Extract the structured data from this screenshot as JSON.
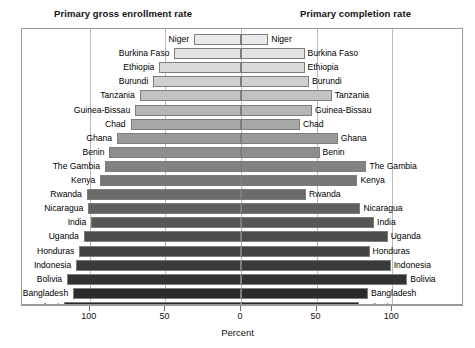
{
  "header": {
    "left_title": "Primary gross enrollment rate",
    "right_title": "Primary completion rate"
  },
  "axis": {
    "title": "Percent",
    "tick_labels": [
      "100",
      "50",
      "0",
      "50",
      "100"
    ],
    "center_value": 0,
    "px_per_percent": 1.512,
    "center_x": 219
  },
  "chart_data": {
    "type": "bar",
    "subtype": "diverging-population-pyramid",
    "title": "",
    "xlabel": "Percent",
    "ylabel": "",
    "grid": true,
    "legend_position": "top",
    "xlim": [
      -125,
      125
    ],
    "xticks": [
      -100,
      -50,
      0,
      50,
      100
    ],
    "xticklabels": [
      "100",
      "50",
      "0",
      "50",
      "100"
    ],
    "series": [
      {
        "name": "Primary gross enrollment rate",
        "side": "left"
      },
      {
        "name": "Primary completion rate",
        "side": "right"
      }
    ],
    "categories": [
      "Niger",
      "Burkina Faso",
      "Ethiopia",
      "Burundi",
      "Tanzania",
      "Guinea-Bissau",
      "Chad",
      "Ghana",
      "Benin",
      "The Gambia",
      "Kenya",
      "Rwanda",
      "Nicaragua",
      "India",
      "Uganda",
      "Honduras",
      "Indonesia",
      "Bolivia",
      "Bangladesh",
      "Malawi"
    ],
    "rows": [
      {
        "country": "Niger",
        "enrollment": 31,
        "completion": 18,
        "shade": "#eaeaea"
      },
      {
        "country": "Burkina Faso",
        "enrollment": 44,
        "completion": 42,
        "shade": "#e2e2e2"
      },
      {
        "country": "Ethiopia",
        "enrollment": 54,
        "completion": 42,
        "shade": "#dadada"
      },
      {
        "country": "Burundi",
        "enrollment": 58,
        "completion": 45,
        "shade": "#d0d0d0"
      },
      {
        "country": "Tanzania",
        "enrollment": 67,
        "completion": 60,
        "shade": "#c2c2c2"
      },
      {
        "country": "Guinea-Bissau",
        "enrollment": 70,
        "completion": 47,
        "shade": "#b6b6b6"
      },
      {
        "country": "Chad",
        "enrollment": 73,
        "completion": 39,
        "shade": "#a8a8a8"
      },
      {
        "country": "Ghana",
        "enrollment": 82,
        "completion": 64,
        "shade": "#9a9a9a"
      },
      {
        "country": "Benin",
        "enrollment": 87,
        "completion": 52,
        "shade": "#8d8d8d"
      },
      {
        "country": "The Gambia",
        "enrollment": 90,
        "completion": 83,
        "shade": "#828282"
      },
      {
        "country": "Kenya",
        "enrollment": 93,
        "completion": 77,
        "shade": "#767676"
      },
      {
        "country": "Rwanda",
        "enrollment": 102,
        "completion": 43,
        "shade": "#6b6b6b"
      },
      {
        "country": "Nicaragua",
        "enrollment": 101,
        "completion": 79,
        "shade": "#606060"
      },
      {
        "country": "India",
        "enrollment": 99,
        "completion": 88,
        "shade": "#565656"
      },
      {
        "country": "Uganda",
        "enrollment": 104,
        "completion": 97,
        "shade": "#4c4c4c"
      },
      {
        "country": "Honduras",
        "enrollment": 107,
        "completion": 85,
        "shade": "#434343"
      },
      {
        "country": "Indonesia",
        "enrollment": 109,
        "completion": 99,
        "shade": "#3a3a3a"
      },
      {
        "country": "Bolivia",
        "enrollment": 115,
        "completion": 110,
        "shade": "#323232"
      },
      {
        "country": "Bangladesh",
        "enrollment": 111,
        "completion": 84,
        "shade": "#2b2b2b"
      },
      {
        "country": "Malawi",
        "enrollment": 117,
        "completion": 78,
        "shade": "#242424"
      }
    ]
  }
}
